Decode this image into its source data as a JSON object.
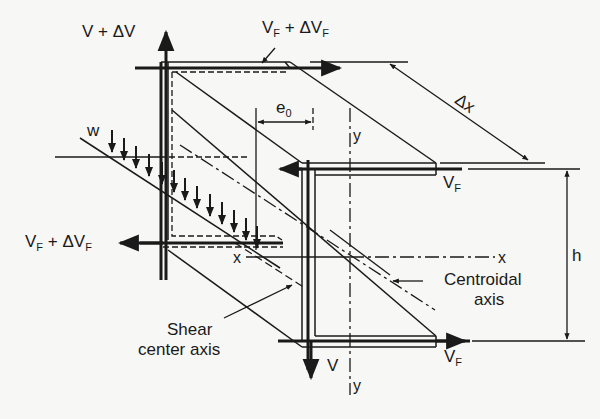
{
  "diagram": {
    "type": "channel-section shear flow free body",
    "ink_color": "#1a1a1a",
    "background": "#f7f7f5"
  },
  "labels": {
    "v_plus_dv": "V + ΔV",
    "vf_plus_dvf_top": {
      "main": "V",
      "sub": "F",
      "rest": " + ΔV",
      "sub2": "F"
    },
    "vf_plus_dvf_left": {
      "main": "V",
      "sub": "F",
      "rest": " + ΔV",
      "sub2": "F"
    },
    "vf_mid_right": {
      "main": "V",
      "sub": "F"
    },
    "vf_bottom_right": {
      "main": "V",
      "sub": "F"
    },
    "v_bottom": "V",
    "w": "w",
    "e0": {
      "main": "e",
      "sub": "0"
    },
    "dx": "Δx",
    "h": "h",
    "y_top": "y",
    "y_bottom": "y",
    "x_left": "x",
    "x_right": "x",
    "centroidal_axis_line1": "Centroidal",
    "centroidal_axis_line2": "axis",
    "shear_center_line1": "Shear",
    "shear_center_line2": "center axis"
  }
}
